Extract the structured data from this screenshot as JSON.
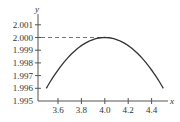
{
  "chart_data": {
    "type": "line",
    "title": "",
    "xlabel": "x",
    "ylabel": "y",
    "xlim": [
      3.45,
      4.6
    ],
    "ylim": [
      1.995,
      2.0015
    ],
    "x_ticks": [
      "3.6",
      "3.8",
      "4.0",
      "4.2",
      "4.4"
    ],
    "y_ticks": [
      "2.001",
      "2.000",
      "1.999",
      "1.998",
      "1.997",
      "1.996",
      "1.995"
    ],
    "grid": false,
    "legend": null,
    "annotations": [
      {
        "type": "dashed-horizontal-line",
        "y": 2.0,
        "from_x": 3.45,
        "to_x": 4.0
      }
    ],
    "series": [
      {
        "name": "curve",
        "x": [
          3.5,
          3.6,
          3.7,
          3.8,
          3.9,
          4.0,
          4.1,
          4.2,
          4.3,
          4.4,
          4.5
        ],
        "values": [
          1.996,
          1.99744,
          1.99856,
          1.99936,
          1.99984,
          2.0,
          1.99984,
          1.99936,
          1.99856,
          1.99744,
          1.996
        ]
      }
    ],
    "colors": {
      "curve": "#333333",
      "axes": "#555555",
      "dashed": "#777777"
    }
  }
}
